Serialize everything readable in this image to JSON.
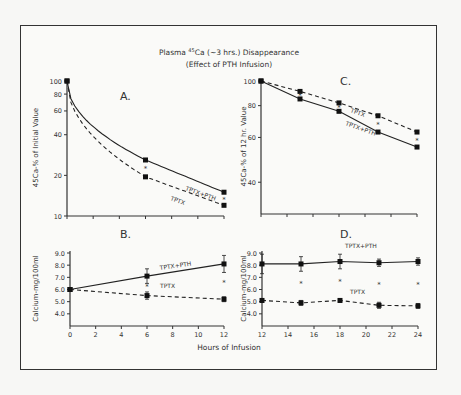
{
  "title": {
    "line1_prefix": "Plasma ",
    "line1_sup": "45",
    "line1_rest": "Ca (~3 hrs.) Disappearance",
    "line2": "(Effect of PTH Infusion)"
  },
  "xlabel": "Hours of Infusion",
  "chart_data": [
    {
      "panel": "A.",
      "type": "line",
      "ylabel": "45Ca-% of Initial Value",
      "yscale": "log",
      "ylim": [
        10,
        100
      ],
      "yticks": [
        10,
        20,
        40,
        60,
        80,
        100
      ],
      "xlim": [
        0,
        12
      ],
      "xticks": [
        0,
        2,
        4,
        6,
        8,
        10,
        12
      ],
      "series": [
        {
          "name": "TPTX+PTH",
          "style": "solid",
          "x": [
            0,
            6,
            12
          ],
          "y": [
            100,
            26,
            15
          ]
        },
        {
          "name": "TPTX",
          "style": "dashed",
          "x": [
            0,
            6,
            12
          ],
          "y": [
            100,
            19.5,
            12
          ]
        }
      ]
    },
    {
      "panel": "B.",
      "type": "line",
      "ylabel": "Calcium-mg/100ml",
      "ylim": [
        3.0,
        9.0
      ],
      "yticks": [
        4.0,
        5.0,
        6.0,
        7.0,
        8.0,
        9.0
      ],
      "xlim": [
        0,
        12
      ],
      "xticks": [
        0,
        2,
        4,
        6,
        8,
        10,
        12
      ],
      "series": [
        {
          "name": "TPTX+PTH",
          "style": "solid",
          "x": [
            0,
            6,
            12
          ],
          "y": [
            6.0,
            7.1,
            8.1
          ],
          "err": [
            0.1,
            0.6,
            0.7
          ]
        },
        {
          "name": "TPTX",
          "style": "dashed",
          "x": [
            0,
            6,
            12
          ],
          "y": [
            6.0,
            5.5,
            5.2
          ],
          "err": [
            0.1,
            0.3,
            0.2
          ]
        }
      ]
    },
    {
      "panel": "C.",
      "type": "line",
      "ylabel": "45Ca-% of 12 hr. Value",
      "yscale": "log",
      "ylim": [
        30,
        100
      ],
      "yticks": [
        40,
        60,
        80,
        100
      ],
      "xlim": [
        12,
        24
      ],
      "xticks": [
        12,
        14,
        16,
        18,
        20,
        22,
        24
      ],
      "series": [
        {
          "name": "TPTX",
          "style": "dashed",
          "x": [
            12,
            15,
            18,
            21,
            24
          ],
          "y": [
            100,
            91,
            82,
            73,
            63
          ]
        },
        {
          "name": "TPTX+PTH",
          "style": "solid",
          "x": [
            12,
            15,
            18,
            21,
            24
          ],
          "y": [
            100,
            85,
            76,
            63,
            55
          ]
        }
      ]
    },
    {
      "panel": "D.",
      "type": "line",
      "ylabel": "Calcium-mg/100ml",
      "ylim": [
        3.0,
        9.0
      ],
      "yticks": [
        4.0,
        5.0,
        6.0,
        7.0,
        8.0,
        9.0
      ],
      "xlim": [
        12,
        24
      ],
      "xticks": [
        12,
        14,
        16,
        18,
        20,
        22,
        24
      ],
      "series": [
        {
          "name": "TPTX+PTH",
          "style": "solid",
          "x": [
            12,
            15,
            18,
            21,
            24
          ],
          "y": [
            8.1,
            8.1,
            8.3,
            8.2,
            8.3
          ],
          "err": [
            0.8,
            0.6,
            0.6,
            0.3,
            0.3
          ]
        },
        {
          "name": "TPTX",
          "style": "dashed",
          "x": [
            12,
            15,
            18,
            21,
            24
          ],
          "y": [
            5.1,
            4.9,
            5.1,
            4.7,
            4.65
          ],
          "err": [
            0.15,
            0.2,
            0.15,
            0.25,
            0.2
          ]
        }
      ]
    }
  ]
}
